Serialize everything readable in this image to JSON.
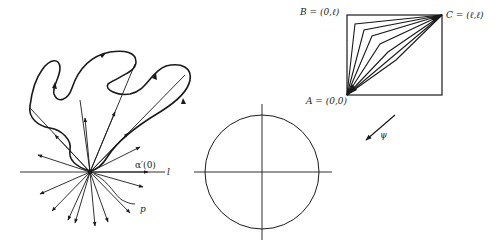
{
  "figure_left": {
    "labels": {
      "alpha_prime": "α′(0)",
      "l": "l",
      "p": "p"
    },
    "description": "Closed curve through point p with tangent vectors radiating from p"
  },
  "figure_middle": {
    "description": "Circle with horizontal and vertical axes"
  },
  "figure_right": {
    "labels": {
      "B": "B = (0,ℓ)",
      "C": "C = (ℓ,ℓ)",
      "A": "A = (0,0)",
      "psi": "ψ"
    },
    "description": "Square with polygonal paths from A to C"
  },
  "colors": {
    "ink": "#1a1a1a",
    "background": "#ffffff"
  }
}
